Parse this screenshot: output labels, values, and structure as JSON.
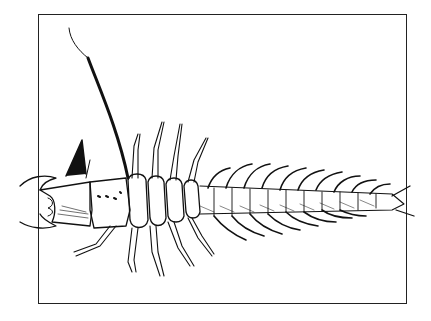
{
  "illustration": {
    "subject": "larva line drawing",
    "ink_color": "#111111",
    "paper_color": "#ffffff",
    "frame": {
      "x": 38,
      "y": 14,
      "width": 369,
      "height": 290
    }
  }
}
